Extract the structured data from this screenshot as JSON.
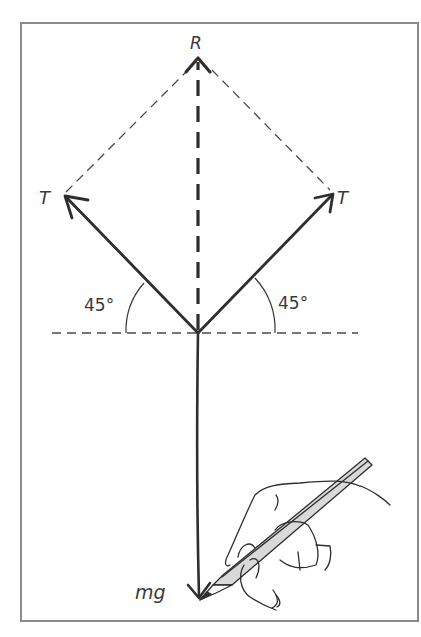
{
  "diagram": {
    "type": "force-vector-diagram",
    "labels": {
      "resultant": "R",
      "tension_left": "T",
      "tension_right": "T",
      "angle_left": "45°",
      "angle_right": "45°",
      "weight": "mg"
    },
    "vectors": [
      {
        "name": "T",
        "direction_deg": 135,
        "style": "solid"
      },
      {
        "name": "T",
        "direction_deg": 45,
        "style": "solid"
      },
      {
        "name": "R",
        "direction_deg": 90,
        "style": "dashed"
      },
      {
        "name": "mg",
        "direction_deg": 270,
        "style": "solid"
      }
    ],
    "construction_lines": [
      "parallelogram dashed edges",
      "horizontal dashed reference line"
    ],
    "illustration": "hand holding pencil drawing the mg arrow",
    "colors": {
      "ink": "#3a3a3a",
      "frame": "#8a8a8a",
      "pencil_fill": "#d9d9d9"
    }
  }
}
